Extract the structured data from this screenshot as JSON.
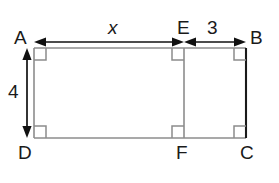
{
  "figure": {
    "type": "geometry-diagram",
    "shape": "rectangle-with-interior-segment",
    "vertex_labels": {
      "A": "A",
      "B": "B",
      "C": "C",
      "D": "D",
      "E": "E",
      "F": "F"
    },
    "dimensions": {
      "top_left_segment": "x",
      "top_right_segment": "3",
      "left_side": "4"
    },
    "colors": {
      "outline": "#8c8c8c",
      "right_edge": "#1a1a1a",
      "interior_line": "#8c8c8c",
      "dimension_arrow": "#111111",
      "label_text": "#1a1a1a",
      "background": "#ffffff"
    },
    "geometry": {
      "rect_left": 34,
      "rect_right": 246,
      "rect_top": 48,
      "rect_bottom": 138,
      "ef_x": 184,
      "dim_top_y": 42,
      "dim_left_x": 27,
      "corner_mark_size": 12
    }
  },
  "labels": {
    "A": {
      "text": "A",
      "x": 14,
      "y": 30
    },
    "B": {
      "text": "B",
      "x": 250,
      "y": 30
    },
    "C": {
      "text": "C",
      "x": 240,
      "y": 142
    },
    "D": {
      "text": "D",
      "x": 18,
      "y": 142
    },
    "E": {
      "text": "E",
      "x": 177,
      "y": 20
    },
    "F": {
      "text": "F",
      "x": 176,
      "y": 142
    },
    "x": {
      "text": "x",
      "x": 108,
      "y": 20
    },
    "three": {
      "text": "3",
      "x": 207,
      "y": 20
    },
    "four": {
      "text": "4",
      "x": 8,
      "y": 82
    }
  }
}
